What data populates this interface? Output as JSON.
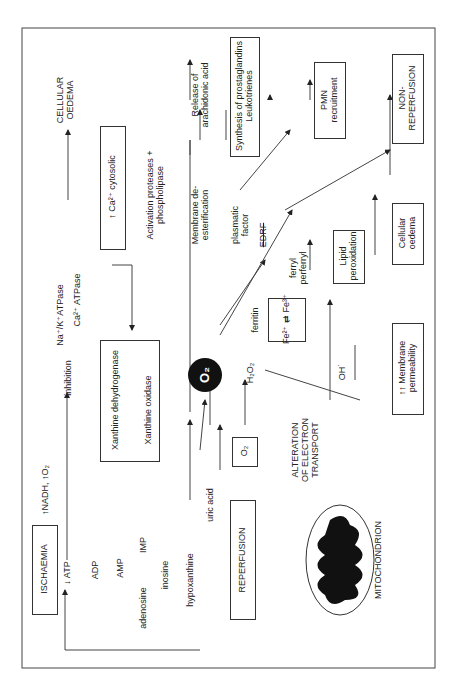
{
  "nodes": {
    "ischaemia": "ISCHAEMIA",
    "nadh": "↑NADH, ↑O₂",
    "atp": "↓ ATP",
    "adp": "ADP",
    "amp": "AMP",
    "imp": "IMP",
    "adenosine": "adenosine",
    "inosine": "inosine",
    "hypoxanthine": "hypoxanthine",
    "uric_acid": "uric acid",
    "reperfusion": "REPERFUSION",
    "o2": "O₂",
    "alteration": "ALTERATION OF ELECTRON TRANSPORT",
    "mitochondrion": "MITOCHONDRION",
    "xdh": "Xanthine dehydrogenase",
    "xo": "Xanthine oxidase",
    "inhibition": "inhibition",
    "nak": "Na⁺/K⁺ATPase",
    "caatp": "Ca²⁺ ATPase",
    "cellular_oedema_top": "CELLULAR OEDEMA",
    "ca_cyto": "↑ Ca²⁺ cytosolic",
    "activation": "Activation proteases + phospholipase",
    "membrane_deest": "Membrane de-esterification",
    "release": "Release of arachidonic acid",
    "synthesis": "Synthesis of prostaglandins Leukotrienes",
    "superoxide": "O₂",
    "plasmatic": "plasmatic factor",
    "edrf": "EDRF",
    "ferritin": "ferritin",
    "fe": "Fe²⁺ ⇄ Fe³⁺",
    "h2o2": "H₂O₂",
    "oh": "OH˙",
    "ferryl": "ferryl perferryl",
    "lipid": "Lipid peroxidation",
    "membrane_perm": "↑↑ Membrane permeability",
    "cellular_oedema": "Cellular oedema",
    "pmn": "PMN recruitment",
    "nonreperfusion": "NON-REPERFUSION"
  }
}
